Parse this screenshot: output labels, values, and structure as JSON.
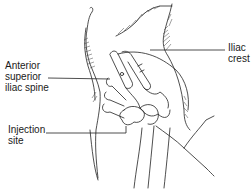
{
  "figure": {
    "labels": {
      "asis": "Anterior\nsuperior\niliac spine",
      "iliac_crest": "Iliac\ncrest",
      "injection_site": "Injection\nsite"
    },
    "colors": {
      "line": "#222222",
      "text": "#1a1a1a",
      "background": "#ffffff"
    }
  }
}
